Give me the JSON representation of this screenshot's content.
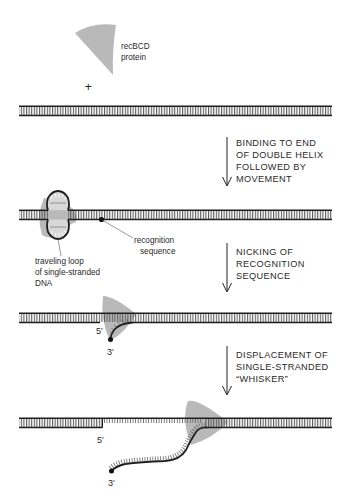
{
  "diagram": {
    "colors": {
      "protein": "#b9b9b9",
      "dna_strand": "#1e1e1e",
      "base_rungs": "#555555",
      "text": "#2a2a2a",
      "background": "#ffffff"
    },
    "protein_label": {
      "line1": "recBCD",
      "line2": "protein"
    },
    "plus_sign": "+",
    "steps": [
      {
        "id": "step1",
        "arrow_label": [
          "BINDING TO END",
          "OF DOUBLE HELIX",
          "FOLLOWED BY",
          "MOVEMENT"
        ]
      },
      {
        "id": "step2",
        "arrow_label": [
          "NICKING OF",
          "RECOGNITION",
          "SEQUENCE"
        ]
      },
      {
        "id": "step3",
        "arrow_label": [
          "DISPLACEMENT OF",
          "SINGLE-STRANDED",
          "“WHISKER”"
        ]
      }
    ],
    "annotations": {
      "recognition_sequence": [
        "recognition",
        "sequence"
      ],
      "traveling_loop": [
        "traveling loop",
        "of single-stranded",
        "DNA"
      ],
      "nick_5prime": "5′",
      "nick_3prime": "3′",
      "whisker_5prime": "5′",
      "whisker_3prime": "3′"
    }
  }
}
